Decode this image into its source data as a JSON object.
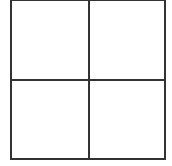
{
  "grid": {
    "rows": 2,
    "columns": 2,
    "line_color": "#333333",
    "background_color": "#ffffff",
    "cells": [
      {
        "position": "top-left",
        "content": ""
      },
      {
        "position": "top-right",
        "content": ""
      },
      {
        "position": "bottom-left",
        "content": ""
      },
      {
        "position": "bottom-right",
        "content": ""
      }
    ]
  }
}
